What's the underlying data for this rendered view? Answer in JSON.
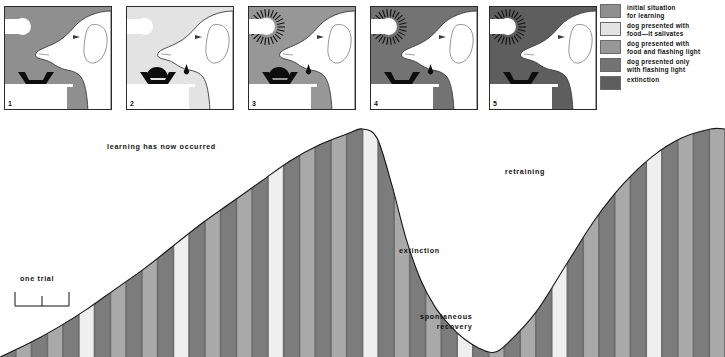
{
  "panels": [
    {
      "number": "1",
      "bg": "#8f8f8f",
      "light_on": false,
      "food": false,
      "saliva": false,
      "icon_bulb": "light-bulb-icon",
      "icon_bowl": "food-bowl-icon",
      "icon_dog": "dog-head-icon"
    },
    {
      "number": "2",
      "bg": "#e3e3e3",
      "light_on": false,
      "food": true,
      "saliva": true,
      "icon_bulb": "light-bulb-icon",
      "icon_bowl": "food-bowl-icon",
      "icon_dog": "dog-head-icon"
    },
    {
      "number": "3",
      "bg": "#979797",
      "light_on": true,
      "food": true,
      "saliva": true,
      "icon_bulb": "flashing-light-icon",
      "icon_bowl": "food-bowl-icon",
      "icon_dog": "dog-head-icon"
    },
    {
      "number": "4",
      "bg": "#737373",
      "light_on": true,
      "food": false,
      "saliva": true,
      "icon_bulb": "flashing-light-icon",
      "icon_bowl": "food-bowl-icon",
      "icon_dog": "dog-head-icon"
    },
    {
      "number": "5",
      "bg": "#5e5e5e",
      "light_on": true,
      "food": false,
      "saliva": false,
      "icon_bulb": "flashing-light-icon",
      "icon_bowl": "food-bowl-icon",
      "icon_dog": "dog-head-icon"
    }
  ],
  "legend": {
    "items": [
      {
        "label": "initial situation\nfor learning",
        "color": "#8f8f8f"
      },
      {
        "label": "dog presented with\nfood—it salivates",
        "color": "#e3e3e3"
      },
      {
        "label": "dog presented with\nfood and flashing light",
        "color": "#979797"
      },
      {
        "label": "dog presented only\nwith flashing light",
        "color": "#737373"
      },
      {
        "label": "extinction",
        "color": "#5e5e5e"
      }
    ]
  },
  "chart_labels": {
    "learning": "learning has now occurred",
    "extinction": "extinction",
    "spontaneous_recovery": "spontaneous\nrecovery",
    "retraining": "retraining",
    "one_trial": "one trial"
  },
  "chart_data": {
    "type": "area",
    "xlabel": "trials",
    "ylabel": "strength of conditioned response",
    "grid": false,
    "legend_position": "top-right",
    "annotations": [
      {
        "text": "learning has now occurred",
        "x": 0.17,
        "y": 0.89
      },
      {
        "text": "extinction",
        "x": 0.56,
        "y": 0.45
      },
      {
        "text": "spontaneous recovery",
        "x": 0.66,
        "y": 0.16
      },
      {
        "text": "retraining",
        "x": 0.72,
        "y": 0.78
      },
      {
        "text": "one trial",
        "x": 0.05,
        "y": 0.33
      }
    ],
    "x": [
      0,
      4,
      8,
      12,
      16,
      20,
      24,
      28,
      32,
      36,
      40,
      44,
      48,
      50,
      52,
      54,
      56,
      58,
      60,
      62,
      64,
      66,
      68,
      70,
      74,
      78,
      82,
      86,
      90,
      94,
      98,
      100
    ],
    "values": [
      0,
      6,
      13,
      21,
      30,
      39,
      49,
      59,
      68,
      77,
      86,
      93,
      98,
      100,
      96,
      76,
      52,
      34,
      22,
      14,
      8,
      4,
      2,
      6,
      20,
      40,
      60,
      76,
      88,
      96,
      100,
      100
    ],
    "stripe_colors": [
      "#7c7c7c",
      "#a9a9a9",
      "#efefef"
    ],
    "stripe_count": 46,
    "ylim": [
      0,
      100
    ],
    "xlim": [
      0,
      100
    ],
    "curve_phases": [
      {
        "name": "learning",
        "x_start": 0,
        "x_end": 50
      },
      {
        "name": "extinction",
        "x_start": 50,
        "x_end": 68
      },
      {
        "name": "spontaneous recovery",
        "x_start": 66,
        "x_end": 70
      },
      {
        "name": "retraining",
        "x_start": 70,
        "x_end": 100
      }
    ]
  }
}
